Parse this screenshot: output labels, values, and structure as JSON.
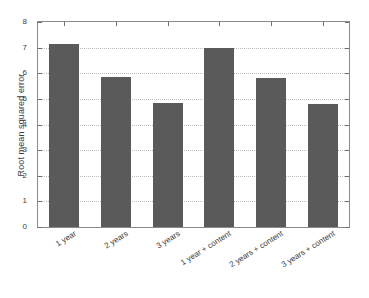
{
  "chart_data": {
    "type": "bar",
    "title": "",
    "xlabel": "",
    "ylabel": "Root mean squared error",
    "categories": [
      "1 year",
      "2 years",
      "3 years",
      "1 year + content",
      "2 years + content",
      "3 years + content"
    ],
    "values": [
      7.15,
      5.87,
      4.85,
      7.0,
      5.8,
      4.8
    ],
    "ylim": [
      0,
      8
    ],
    "yticks": [
      "0",
      "1",
      "2",
      "3",
      "4",
      "5",
      "6",
      "7",
      "8"
    ],
    "ytick_values": [
      0,
      1,
      2,
      3,
      4,
      5,
      6,
      7,
      8
    ],
    "grid": true,
    "legend": null,
    "bar_color": "#5a5a5a",
    "grid_color": "#bdbdbd",
    "axis_color": "#8a8a8a",
    "text_color": "#3c3c3c",
    "background": "#ffffff"
  }
}
